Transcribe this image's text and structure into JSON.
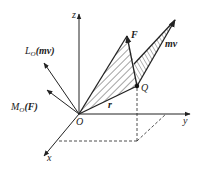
{
  "diagram": {
    "colors": {
      "stroke": "#222222",
      "hatch": "#333333",
      "background": "#ffffff"
    },
    "axes": {
      "z": {
        "label": "z"
      },
      "y": {
        "label": "y"
      },
      "x": {
        "label": "x"
      },
      "origin": {
        "label": "O"
      }
    },
    "vectors": {
      "force": {
        "label": "F"
      },
      "momentum": {
        "label": "mv"
      },
      "position": {
        "label": "r"
      },
      "moment_of_force": {
        "label_main": "M",
        "label_sub": "O",
        "label_arg": "(F)"
      },
      "angular_momentum": {
        "label_main": "L",
        "label_sub": "O",
        "label_arg": "(mv)"
      }
    },
    "points": {
      "Q": {
        "label": "Q"
      }
    }
  }
}
